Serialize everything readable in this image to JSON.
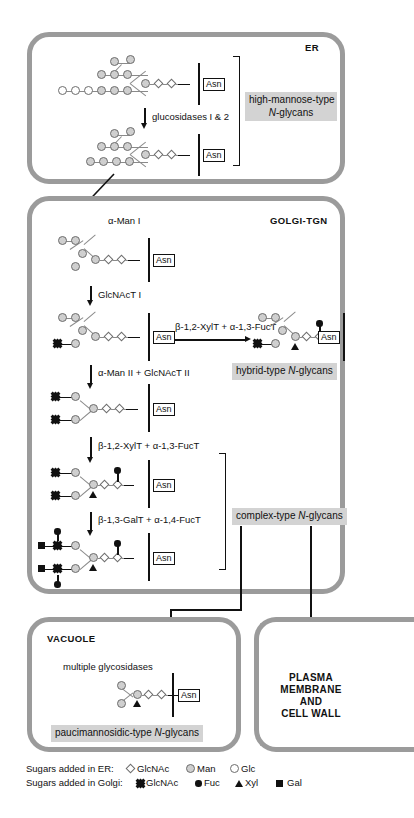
{
  "diagram": {
    "compartments": [
      {
        "key": "er",
        "label": "ER"
      },
      {
        "key": "golgi",
        "label": "GOLGI-TGN"
      },
      {
        "key": "vacuole",
        "label": "VACUOLE"
      }
    ],
    "destination_label": "PLASMA\nMEMBRANE\nAND\nCELL WALL",
    "destination_lines": [
      "PLASMA",
      "MEMBRANE",
      "AND",
      "CELL WALL"
    ]
  },
  "er": {
    "label": "ER",
    "enzyme_step": "glucosidases I & 2",
    "callout": {
      "line1": "high-mannose-type",
      "line2": "N-glycans",
      "italic_part": "N"
    },
    "glycans": [
      {
        "name": "Glc3Man9GlcNAc2-Asn",
        "asn": "Asn"
      },
      {
        "name": "Man9GlcNAc2-Asn",
        "asn": "Asn"
      }
    ]
  },
  "golgi": {
    "label": "GOLGI-TGN",
    "entry_enzyme": "α-Man I",
    "steps": [
      "GlcNAcT I",
      "β-1,2-XylT + α-1,3-FucT",
      "α-Man II + GlcNAcT II",
      "β-1,2-XylT + α-1,3-FucT",
      "β-1,3-GalT + α-1,4-FucT"
    ],
    "callouts": [
      {
        "text": "hybrid-type N-glycans",
        "italic_part": "N"
      },
      {
        "text": "complex-type N-glycans",
        "italic_part": "N"
      }
    ],
    "glycans": [
      {
        "name": "Man5GlcNAc2-Asn",
        "asn": "Asn"
      },
      {
        "name": "GlcNAcMan5GlcNAc2-Asn",
        "asn": "Asn"
      },
      {
        "name": "hybrid-type xylosylated/fucosylated",
        "asn": "Asn"
      },
      {
        "name": "GlcNAc2Man3GlcNAc2-Asn",
        "asn": "Asn"
      },
      {
        "name": "GlcNAc2Man3XylFucGlcNAc2-Asn",
        "asn": "Asn"
      },
      {
        "name": "Lewis-a complex-type",
        "asn": "Asn"
      }
    ]
  },
  "vacuole": {
    "label": "VACUOLE",
    "enzyme_step": "multiple glycosidases",
    "callout": {
      "text": "paucimannosidic-type N-glycans",
      "italic_part": "N"
    },
    "glycans": [
      {
        "name": "Man2XylFucGlcNAc2-Asn",
        "asn": "Asn"
      }
    ]
  },
  "legend": {
    "rows": [
      {
        "label": "Sugars added in ER:",
        "items": [
          {
            "symbol": "glcnac-er-icon",
            "name": "GlcNAc"
          },
          {
            "symbol": "man-icon",
            "name": "Man"
          },
          {
            "symbol": "glc-icon",
            "name": "Glc"
          }
        ]
      },
      {
        "label": "Sugars added in Golgi:",
        "items": [
          {
            "symbol": "glcnac-golgi-icon",
            "name": "GlcNAc"
          },
          {
            "symbol": "fuc-icon",
            "name": "Fuc"
          },
          {
            "symbol": "xyl-icon",
            "name": "Xyl"
          },
          {
            "symbol": "gal-icon",
            "name": "Gal"
          }
        ]
      }
    ]
  },
  "colors": {
    "compartment_border": "#9b9b9b",
    "highlight_bg": "#d3d3d3",
    "sugar_shaded": "#cfcfcf",
    "sugar_outline": "#6d6d6d",
    "ink": "#111111"
  }
}
